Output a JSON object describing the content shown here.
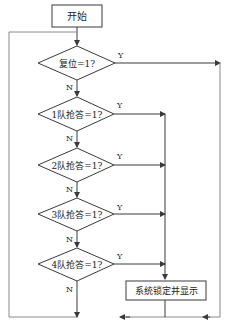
{
  "flowchart": {
    "start": {
      "label": "开始"
    },
    "decisions": [
      {
        "label": "复位=1?",
        "yes": "Y",
        "no": "N"
      },
      {
        "label": "1队抢答=1?",
        "yes": "Y",
        "no": "N"
      },
      {
        "label": "2队抢答=1?",
        "yes": "Y",
        "no": "N"
      },
      {
        "label": "3队抢答=1?",
        "yes": "Y",
        "no": "N"
      },
      {
        "label": "4队抢答=1?",
        "yes": "Y",
        "no": "N"
      }
    ],
    "process": {
      "label": "系统锁定并显示"
    },
    "colors": {
      "line": "#3a3a3a",
      "loop_line": "#8a8a8a",
      "background": "#ffffff"
    }
  }
}
